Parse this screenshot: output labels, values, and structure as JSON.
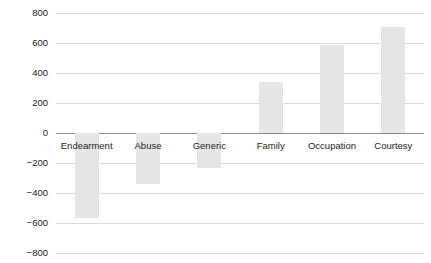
{
  "chart_data": {
    "type": "bar",
    "title": "",
    "subtitle": "",
    "xlabel": "",
    "ylabel": "",
    "categories": [
      "Endearment",
      "Abuse",
      "Generic",
      "Family",
      "Occupation",
      "Courtesy"
    ],
    "values": [
      -565,
      -340,
      -235,
      340,
      590,
      710
    ],
    "ylim": [
      -800,
      800
    ],
    "yticks": [
      800,
      600,
      400,
      200,
      0,
      -200,
      -400,
      -600,
      -800
    ],
    "ytick_labels": [
      "800",
      "600",
      "400",
      "200",
      "0",
      "−200",
      "−400",
      "−600",
      "−800"
    ],
    "grid": true,
    "legend": false,
    "legend_position": "none",
    "bar_color": "#e6e6e6",
    "gridline_color": "#d9d9d9",
    "axis_color": "#8c8c8c",
    "text_color": "#1c1c1c",
    "background": "#ffffff",
    "category_labels_below_zero_axis": true,
    "series": [
      {
        "name": "value",
        "values": [
          -565,
          -340,
          -235,
          340,
          590,
          710
        ]
      }
    ]
  },
  "layout": {
    "plot_left": 56,
    "plot_right": 424,
    "zero_y": 133,
    "px_per_200": 30,
    "bar_width": 24,
    "label_baseline_offset": 13,
    "tick_font_px": 9.5,
    "category_font_px": 9.5
  }
}
